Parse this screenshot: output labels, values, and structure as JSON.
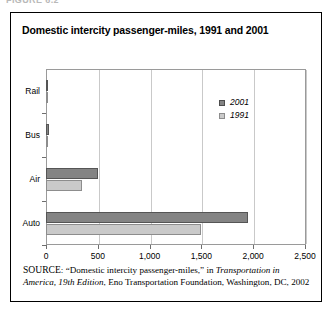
{
  "figure_strip": {
    "stub": "FIGURE 6.2"
  },
  "card": {
    "title": "Domestic intercity passenger-miles, 1991 and 2001"
  },
  "legend": {
    "position": "inside-top-right",
    "entries": [
      {
        "label": "2001",
        "color": "#848484"
      },
      {
        "label": "1991",
        "color": "#cacaca"
      }
    ]
  },
  "axis": {
    "x_ticks": [
      "0",
      "500",
      "1,000",
      "1,500",
      "2,000",
      "2,500"
    ],
    "y_ticks": [
      "Rail",
      "Bus",
      "Air",
      "Auto"
    ]
  },
  "source": {
    "prefix": "SOURCE",
    "line1_a": ": “Domestic intercity passenger-miles,” in ",
    "italic1": "Transportation in America, 19th Edition",
    "line1_b": ", Eno Transportation Foundation, Washington, DC, 2002"
  },
  "chart_data": {
    "type": "bar",
    "orientation": "horizontal",
    "title": "Domestic intercity passenger-miles, 1991 and 2001",
    "xlabel": "",
    "ylabel": "",
    "categories": [
      "Rail",
      "Bus",
      "Air",
      "Auto"
    ],
    "series": [
      {
        "name": "2001",
        "color": "#848484",
        "values": [
          13,
          28,
          500,
          1950
        ]
      },
      {
        "name": "1991",
        "color": "#cacaca",
        "values": [
          13,
          23,
          350,
          1500
        ]
      }
    ],
    "xlim": [
      0,
      2500
    ],
    "xticks": [
      0,
      500,
      1000,
      1500,
      2000,
      2500
    ],
    "xtick_labels": [
      "0",
      "500",
      "1,000",
      "1,500",
      "2,000",
      "2,500"
    ],
    "grid": "vertical-only",
    "legend_position": "inside-top-right",
    "units": "billions of passenger-miles"
  }
}
